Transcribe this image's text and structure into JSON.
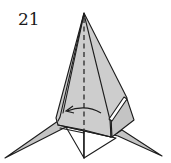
{
  "diagram": {
    "type": "origami-folding-step",
    "step_number": "21",
    "instruction_symbols": [
      {
        "name": "valley-fold-line",
        "style": "dashed",
        "orientation": "vertical-center"
      },
      {
        "name": "fold-arrow",
        "direction": "right-to-left"
      }
    ],
    "colors": {
      "paper": "#c4c4c4",
      "paper_reverse": "#ffffff",
      "line": "#1c1c1c",
      "background": "#ffffff"
    }
  }
}
